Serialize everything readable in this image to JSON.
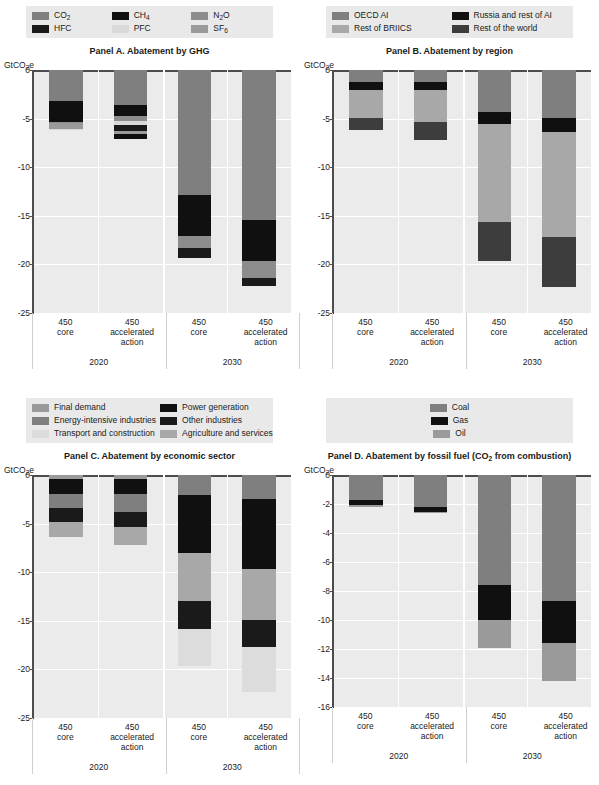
{
  "figure": {
    "x_categories": [
      {
        "line1": "450",
        "line2": "core",
        "line3": ""
      },
      {
        "line1": "450",
        "line2": "accelerated",
        "line3": "action"
      },
      {
        "line1": "450",
        "line2": "core",
        "line3": ""
      },
      {
        "line1": "450",
        "line2": "accelerated",
        "line3": "action"
      }
    ],
    "year_groups": [
      "2020",
      "2030"
    ],
    "y_unit": "GtCO2e"
  },
  "colors": {
    "mid_grey": "#7f7f7f",
    "black": "#101010",
    "light_grey": "#bfbfbf",
    "dark_grey": "#404040",
    "pale_grey": "#d9d9d9",
    "very_light": "#e0e0e0",
    "plot_bg": "#ebebeb",
    "legend_bg": "#e9e9e9",
    "axis": "#4d4d4d"
  },
  "panel_a": {
    "title": "Panel A. Abatement by GHG",
    "legend": [
      {
        "label": "CO2",
        "sub": "2",
        "base": "CO",
        "tail": "",
        "color": "#7f7f7f"
      },
      {
        "label": "CH4",
        "sub": "4",
        "base": "CH",
        "tail": "",
        "color": "#101010"
      },
      {
        "label": "N2O",
        "sub": "2",
        "base": "N",
        "tail": "O",
        "color": "#8c8c8c"
      },
      {
        "label": "HFC",
        "sub": "",
        "base": "HFC",
        "tail": "",
        "color": "#1a1a1a"
      },
      {
        "label": "PFC",
        "sub": "",
        "base": "PFC",
        "tail": "",
        "color": "#d9d9d9"
      },
      {
        "label": "SF6",
        "sub": "6",
        "base": "SF",
        "tail": "",
        "color": "#9a9a9a"
      }
    ],
    "chart_data": {
      "type": "bar",
      "title": "Panel A. Abatement by GHG",
      "xlabel": "",
      "ylabel": "GtCO2e",
      "ylim": [
        -25,
        0
      ],
      "yticks": [
        0,
        -5,
        -10,
        -15,
        -20,
        -25
      ],
      "grid": true,
      "stacked": true,
      "categories": [
        "450 core (2020)",
        "450 accelerated action (2020)",
        "450 core (2030)",
        "450 accelerated action (2030)"
      ],
      "series": [
        {
          "name": "CO2",
          "color": "#7f7f7f",
          "values": [
            -3.2,
            -3.6,
            -12.9,
            -15.4
          ]
        },
        {
          "name": "CH4",
          "color": "#101010",
          "values": [
            -2.1,
            -1.1,
            -4.2,
            -4.3
          ]
        },
        {
          "name": "N2O",
          "color": "#8c8c8c",
          "values": [
            -0.15,
            -0.5,
            -0.55,
            -0.0
          ]
        },
        {
          "name": "HFC",
          "color": "#1a1a1a",
          "values": [
            -0.0,
            -0.6,
            -0.0,
            -0.0
          ]
        },
        {
          "name": "PFC",
          "color": "#d9d9d9",
          "values": [
            -0.05,
            -0.2,
            -0.4,
            -2.0
          ]
        },
        {
          "name": "SF6",
          "color": "#9a9a9a",
          "values": [
            -0.6,
            -0.5,
            -0.9,
            -0.9
          ]
        }
      ],
      "totals": [
        -6.1,
        -7.1,
        -19.3,
        -22.2
      ]
    }
  },
  "panel_b": {
    "title": "Panel B. Abatement by region",
    "legend": [
      {
        "label": "OECD AI",
        "color": "#7f7f7f"
      },
      {
        "label": "Russia and rest of AI",
        "color": "#101010"
      },
      {
        "label": "Rest of BRIICS",
        "color": "#a8a8a8"
      },
      {
        "label": "Rest of the world",
        "color": "#3d3d3d"
      }
    ],
    "chart_data": {
      "type": "bar",
      "title": "Panel B. Abatement by region",
      "xlabel": "",
      "ylabel": "GtCO2e",
      "ylim": [
        -25,
        0
      ],
      "yticks": [
        0,
        -5,
        -10,
        -15,
        -20,
        -25
      ],
      "grid": true,
      "stacked": true,
      "categories": [
        "450 core (2020)",
        "450 accelerated action (2020)",
        "450 core (2030)",
        "450 accelerated action (2030)"
      ],
      "series": [
        {
          "name": "OECD AI",
          "color": "#7f7f7f",
          "values": [
            -0.0,
            -0.0,
            -0.0,
            -0.0
          ]
        },
        {
          "name": "Russia and rest of AI",
          "color": "#101010",
          "values": [
            -1.3,
            -1.3,
            -1.3,
            -1.5
          ]
        },
        {
          "name": "Rest of BRIICS",
          "color": "#a8a8a8",
          "values": [
            -3.4,
            -3.9,
            -9.9,
            -10.6
          ]
        },
        {
          "name": "Rest of the world",
          "color": "#3d3d3d",
          "values": [
            -1.4,
            -1.9,
            -4.1,
            -5.0
          ]
        }
      ],
      "segments": [
        [
          {
            "name": "OECD AI",
            "from": 0,
            "to": -1.2
          },
          {
            "name": "Russia and rest of AI",
            "from": -1.2,
            "to": -2.1
          },
          {
            "name": "Rest of BRIICS",
            "from": -2.1,
            "to": -4.9
          },
          {
            "name": "Rest of the world",
            "from": -4.9,
            "to": -6.2
          }
        ],
        [
          {
            "name": "OECD AI",
            "from": 0,
            "to": -1.2
          },
          {
            "name": "Russia and rest of AI",
            "from": -1.2,
            "to": -2.1
          },
          {
            "name": "Rest of BRIICS",
            "from": -2.1,
            "to": -5.3
          },
          {
            "name": "Rest of the world",
            "from": -5.3,
            "to": -7.2
          }
        ],
        [
          {
            "name": "OECD AI",
            "from": 0,
            "to": -4.3
          },
          {
            "name": "Russia and rest of AI",
            "from": -4.3,
            "to": -5.6
          },
          {
            "name": "Rest of BRIICS",
            "from": -5.6,
            "to": -15.6
          },
          {
            "name": "Rest of the world",
            "from": -15.6,
            "to": -19.7
          }
        ],
        [
          {
            "name": "OECD AI",
            "from": 0,
            "to": -4.9
          },
          {
            "name": "Russia and rest of AI",
            "from": -4.9,
            "to": -6.4
          },
          {
            "name": "Rest of BRIICS",
            "from": -6.4,
            "to": -17.2
          },
          {
            "name": "Rest of the world",
            "from": -17.2,
            "to": -22.3
          }
        ]
      ],
      "totals": [
        -6.2,
        -7.2,
        -19.7,
        -22.3
      ]
    }
  },
  "panel_c": {
    "title": "Panel C. Abatement by economic sector",
    "legend": [
      {
        "label": "Final demand",
        "color": "#9a9a9a"
      },
      {
        "label": "Power generation",
        "color": "#101010"
      },
      {
        "label": "Energy-intensive industries",
        "color": "#7f7f7f"
      },
      {
        "label": "Other industries",
        "color": "#1a1a1a"
      },
      {
        "label": "Transport and construction",
        "color": "#dcdcdc"
      },
      {
        "label": "Agriculture and services",
        "color": "#a8a8a8"
      }
    ],
    "chart_data": {
      "type": "bar",
      "title": "Panel C. Abatement by economic sector",
      "xlabel": "",
      "ylabel": "GtCO2e",
      "ylim": [
        -25,
        0
      ],
      "yticks": [
        0,
        -5,
        -10,
        -15,
        -20,
        -25
      ],
      "grid": true,
      "stacked": true,
      "categories": [
        "450 core (2020)",
        "450 accelerated action (2020)",
        "450 core (2030)",
        "450 accelerated action (2030)"
      ],
      "segments": [
        [
          {
            "name": "Final demand",
            "from": 0,
            "to": -0.4
          },
          {
            "name": "Power generation",
            "from": -0.4,
            "to": -2.0
          },
          {
            "name": "Energy-intensive industries",
            "from": -2.0,
            "to": -3.4
          },
          {
            "name": "Other industries",
            "from": -3.4,
            "to": -4.8
          },
          {
            "name": "Agriculture and services",
            "from": -4.8,
            "to": -6.4
          }
        ],
        [
          {
            "name": "Final demand",
            "from": 0,
            "to": -0.4
          },
          {
            "name": "Power generation",
            "from": -0.4,
            "to": -2.0
          },
          {
            "name": "Energy-intensive industries",
            "from": -2.0,
            "to": -3.8
          },
          {
            "name": "Other industries",
            "from": -3.8,
            "to": -5.3
          },
          {
            "name": "Agriculture and services",
            "from": -5.3,
            "to": -7.2
          }
        ],
        [
          {
            "name": "Energy-intensive industries",
            "from": 0,
            "to": -2.1
          },
          {
            "name": "Power generation",
            "from": -2.1,
            "to": -8.0
          },
          {
            "name": "Agriculture and services",
            "from": -8.0,
            "to": -13.0
          },
          {
            "name": "Other industries",
            "from": -13.0,
            "to": -15.8
          },
          {
            "name": "Transport and construction",
            "from": -15.8,
            "to": -19.7
          }
        ],
        [
          {
            "name": "Energy-intensive industries",
            "from": 0,
            "to": -2.5
          },
          {
            "name": "Power generation",
            "from": -2.5,
            "to": -9.7
          },
          {
            "name": "Agriculture and services",
            "from": -9.7,
            "to": -14.9
          },
          {
            "name": "Other industries",
            "from": -14.9,
            "to": -17.7
          },
          {
            "name": "Transport and construction",
            "from": -17.7,
            "to": -22.3
          }
        ]
      ],
      "totals": [
        -6.4,
        -7.2,
        -19.7,
        -22.3
      ]
    }
  },
  "panel_d": {
    "title_prefix": "Panel D. Abatement by fossil fuel (CO",
    "title_sub": "2",
    "title_suffix": " from combustion)",
    "legend": [
      {
        "label": "Coal",
        "color": "#7f7f7f"
      },
      {
        "label": "Gas",
        "color": "#101010"
      },
      {
        "label": "Oil",
        "color": "#9a9a9a"
      }
    ],
    "chart_data": {
      "type": "bar",
      "title": "Panel D. Abatement by fossil fuel (CO2 from combustion)",
      "xlabel": "",
      "ylabel": "GtCO2e",
      "ylim": [
        -16,
        0
      ],
      "yticks": [
        0,
        -2,
        -4,
        -6,
        -8,
        -10,
        -12,
        -14,
        -16
      ],
      "grid": true,
      "stacked": true,
      "categories": [
        "450 core (2020)",
        "450 accelerated action (2020)",
        "450 core (2030)",
        "450 accelerated action (2030)"
      ],
      "segments": [
        [
          {
            "name": "Coal",
            "from": 0,
            "to": -1.75
          },
          {
            "name": "Gas",
            "from": -1.75,
            "to": -2.1
          },
          {
            "name": "Oil",
            "from": -2.1,
            "to": -2.2
          }
        ],
        [
          {
            "name": "Coal",
            "from": 0,
            "to": -2.2
          },
          {
            "name": "Gas",
            "from": -2.2,
            "to": -2.55
          },
          {
            "name": "Oil",
            "from": -2.55,
            "to": -2.6
          }
        ],
        [
          {
            "name": "Coal",
            "from": 0,
            "to": -7.6
          },
          {
            "name": "Gas",
            "from": -7.6,
            "to": -10.0
          },
          {
            "name": "Oil",
            "from": -10.0,
            "to": -11.9
          }
        ],
        [
          {
            "name": "Coal",
            "from": 0,
            "to": -8.7
          },
          {
            "name": "Gas",
            "from": -8.7,
            "to": -11.6
          },
          {
            "name": "Oil",
            "from": -11.6,
            "to": -14.2
          }
        ]
      ],
      "totals": [
        -2.2,
        -2.6,
        -11.9,
        -14.2
      ]
    }
  }
}
